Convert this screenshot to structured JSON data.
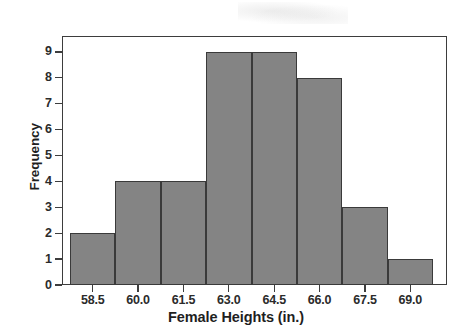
{
  "chart_data": {
    "type": "bar",
    "title": "",
    "subtitle": "",
    "xlabel": "Female Heights (in.)",
    "ylabel": "Frequency",
    "categories": [
      "58.5",
      "60.0",
      "61.5",
      "63.0",
      "64.5",
      "66.0",
      "67.5",
      "69.0"
    ],
    "values": [
      2,
      4,
      4,
      9,
      9,
      8,
      3,
      1
    ],
    "bin_centers": [
      58.5,
      60.0,
      61.5,
      63.0,
      64.5,
      66.0,
      67.5,
      69.0
    ],
    "bin_width": 1.5,
    "bin_edges": [
      57.75,
      59.25,
      60.75,
      62.25,
      63.75,
      65.25,
      66.75,
      68.25,
      69.75
    ],
    "xtick_labels": [
      "58.5",
      "60.0",
      "61.5",
      "63.0",
      "64.5",
      "66.0",
      "67.5",
      "69.0"
    ],
    "ytick_labels": [
      "0",
      "1",
      "2",
      "3",
      "4",
      "5",
      "6",
      "7",
      "8",
      "9"
    ],
    "ytick_values": [
      0,
      1,
      2,
      3,
      4,
      5,
      6,
      7,
      8,
      9
    ],
    "ylim": [
      0,
      9.6
    ],
    "xlim": [
      57.5,
      70.0
    ],
    "grid": false,
    "legend": false,
    "legend_position": "none",
    "total_count": 40,
    "bar_fill_color": "#848484",
    "bar_edge_color": "#3a3a3a",
    "axis_color": "#3d3d3d",
    "background_color": "#ffffff",
    "text_color": "#1f1f1f"
  },
  "figure": {
    "frame_visible": true,
    "watermark_text": ""
  }
}
